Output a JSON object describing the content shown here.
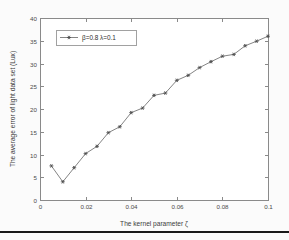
{
  "chart_data": {
    "type": "line",
    "title": "",
    "xlabel": "The kernel parameter ζ",
    "ylabel": "The average error of light data set (Lux)",
    "xlim": [
      0,
      0.1
    ],
    "ylim": [
      0,
      40
    ],
    "grid": false,
    "legend_position": "upper-left",
    "xticks": [
      "0",
      "0.02",
      "0.04",
      "0.06",
      "0.08",
      "0.1"
    ],
    "xtick_values": [
      0,
      0.02,
      0.04,
      0.06,
      0.08,
      0.1
    ],
    "yticks": [
      "0",
      "5",
      "10",
      "15",
      "20",
      "25",
      "30",
      "35",
      "40"
    ],
    "ytick_values": [
      0,
      5,
      10,
      15,
      20,
      25,
      30,
      35,
      40
    ],
    "series": [
      {
        "name": "β=0.8 λ=0.1",
        "marker": "asterisk",
        "color": "#6e6e6e",
        "x": [
          0.005,
          0.01,
          0.015,
          0.02,
          0.025,
          0.03,
          0.035,
          0.04,
          0.045,
          0.05,
          0.055,
          0.06,
          0.065,
          0.07,
          0.075,
          0.08,
          0.085,
          0.09,
          0.095,
          0.1
        ],
        "values": [
          7.5,
          4.0,
          7.1,
          10.2,
          11.8,
          14.8,
          16.1,
          19.2,
          20.2,
          23.0,
          23.5,
          26.3,
          27.4,
          29.1,
          30.4,
          31.6,
          32.0,
          33.9,
          34.9,
          36.0
        ]
      }
    ]
  },
  "legend": {
    "entries": [
      {
        "label": "β=0.8 λ=0.1"
      }
    ]
  },
  "axes": {
    "x_title": "The kernel parameter ζ",
    "y_title": "The average error of light data set (Lux)"
  }
}
